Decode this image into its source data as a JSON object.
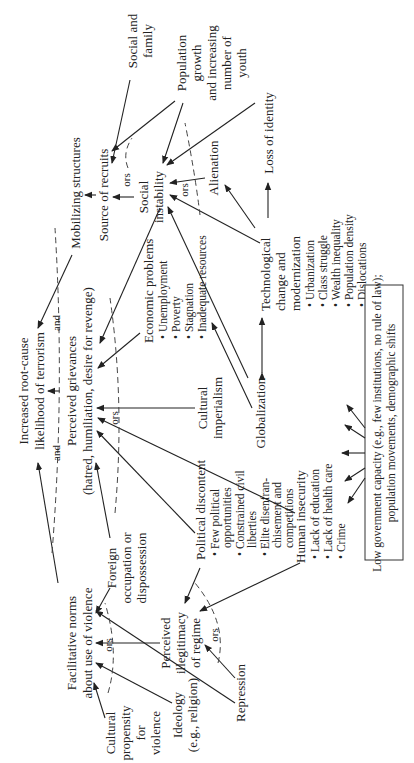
{
  "diagram": {
    "orientation": "rotated 90 degrees counter-clockwise",
    "nodes": {
      "outcome": {
        "line1": "Increased root-cause",
        "line2": "likelihood of terrorism"
      },
      "grievances": {
        "line1": "Perceived grievances",
        "line2": "(hatred, humiliation, desire for revenge)"
      },
      "mobilizing": {
        "label": "Mobilizing structures"
      },
      "recruits": {
        "label": "Source of recruits"
      },
      "social_family": {
        "line1": "Social and",
        "line2": "family"
      },
      "population": {
        "line1": "Population",
        "line2": "growth",
        "line3": "and increasing",
        "line4": "number of",
        "line5": "youth"
      },
      "social_instability": {
        "line1": "Social",
        "line2": "instability"
      },
      "loss_identity": {
        "label": "Loss of identity"
      },
      "alienation": {
        "label": "Alienation"
      },
      "technological": {
        "line1": "Technological",
        "line2": "change and",
        "line3": "modernization",
        "bullets": [
          "Urbanization",
          "Class struggle",
          "Wealth inequality",
          "Population density",
          "Dislocations"
        ]
      },
      "globalization": {
        "label": "Globalization"
      },
      "economic": {
        "title": "Economic problems",
        "bullets": [
          "Unemployment",
          "Poverty",
          "Stagnation",
          "Inadequate resources"
        ]
      },
      "cultural_imperialism": {
        "line1": "Cultural",
        "line2": "imperialism"
      },
      "political_discontent": {
        "title": "Political discontent",
        "bullets": [
          {
            "line1": "Few political",
            "line2": "opportunities"
          },
          {
            "line1": "Constrained civil",
            "line2": "liberties"
          },
          {
            "line1": "Elite disenfran-",
            "line2": "chisement and",
            "line3": "competitions"
          }
        ]
      },
      "human_insecurity": {
        "title": "Human insecurity",
        "bullets": [
          "Lack of education",
          "Lack of health care",
          "Crime"
        ]
      },
      "low_gov": {
        "line1": "Low government capacity (e.g., few institutions, no rule of law);",
        "line2": "population movements, demographic shifts"
      },
      "facilitative": {
        "line1": "Facilitative norms",
        "line2": "about use of violence"
      },
      "foreign": {
        "line1": "Foreign",
        "line2": "occupation or",
        "line3": "dispossession"
      },
      "illegitimacy": {
        "line1": "Perceived",
        "line2": "illegitimacy",
        "line3": "of regime"
      },
      "cultural_propensity": {
        "line1": "Cultural",
        "line2": "propensity",
        "line3": "for",
        "line4": "violence"
      },
      "ideology": {
        "line1": "Ideology",
        "line2": "(e.g., religion)"
      },
      "repression": {
        "label": "Repression"
      }
    },
    "connectors": {
      "and": "and",
      "ors": "ors"
    }
  }
}
